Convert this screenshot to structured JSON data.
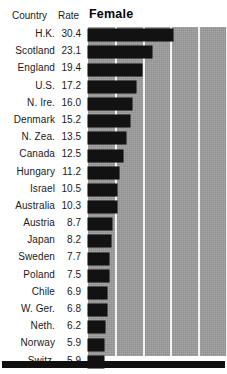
{
  "header": {
    "country_label": "Country",
    "rate_label": "Rate",
    "series_label": "Female"
  },
  "chart_data": {
    "type": "bar",
    "title": "Female",
    "xlabel": "",
    "ylabel": "Country",
    "orientation": "horizontal",
    "grid": true,
    "gridline_values": [
      10,
      20,
      30,
      40,
      50
    ],
    "xlim": [
      0,
      50
    ],
    "bar_color": "#121212",
    "plot_background": "#9d9d9d",
    "gridline_color": "#f2f2f2",
    "categories": [
      "H.K.",
      "Scotland",
      "England",
      "U.S.",
      "N. Ire.",
      "Denmark",
      "N. Zea.",
      "Canada",
      "Hungary",
      "Israel",
      "Australia",
      "Austria",
      "Japan",
      "Sweden",
      "Poland",
      "Chile",
      "W. Ger.",
      "Neth.",
      "Norway",
      "Switz."
    ],
    "values": [
      30.4,
      23.1,
      19.4,
      17.2,
      16.0,
      15.2,
      13.5,
      12.5,
      11.2,
      10.5,
      10.3,
      8.7,
      8.2,
      7.7,
      7.5,
      6.9,
      6.8,
      6.2,
      5.9,
      5.9
    ]
  },
  "rows": [
    {
      "country": "H.K.",
      "rate": "30.4",
      "value": 30.4
    },
    {
      "country": "Scotland",
      "rate": "23.1",
      "value": 23.1
    },
    {
      "country": "England",
      "rate": "19.4",
      "value": 19.4
    },
    {
      "country": "U.S.",
      "rate": "17.2",
      "value": 17.2
    },
    {
      "country": "N. Ire.",
      "rate": "16.0",
      "value": 16.0
    },
    {
      "country": "Denmark",
      "rate": "15.2",
      "value": 15.2
    },
    {
      "country": "N. Zea.",
      "rate": "13.5",
      "value": 13.5
    },
    {
      "country": "Canada",
      "rate": "12.5",
      "value": 12.5
    },
    {
      "country": "Hungary",
      "rate": "11.2",
      "value": 11.2
    },
    {
      "country": "Israel",
      "rate": "10.5",
      "value": 10.5
    },
    {
      "country": "Australia",
      "rate": "10.3",
      "value": 10.3
    },
    {
      "country": "Austria",
      "rate": "8.7",
      "value": 8.7
    },
    {
      "country": "Japan",
      "rate": "8.2",
      "value": 8.2
    },
    {
      "country": "Sweden",
      "rate": "7.7",
      "value": 7.7
    },
    {
      "country": "Poland",
      "rate": "7.5",
      "value": 7.5
    },
    {
      "country": "Chile",
      "rate": "6.9",
      "value": 6.9
    },
    {
      "country": "W. Ger.",
      "rate": "6.8",
      "value": 6.8
    },
    {
      "country": "Neth.",
      "rate": "6.2",
      "value": 6.2
    },
    {
      "country": "Norway",
      "rate": "5.9",
      "value": 5.9
    },
    {
      "country": "Switz.",
      "rate": "5.9",
      "value": 5.9
    }
  ]
}
